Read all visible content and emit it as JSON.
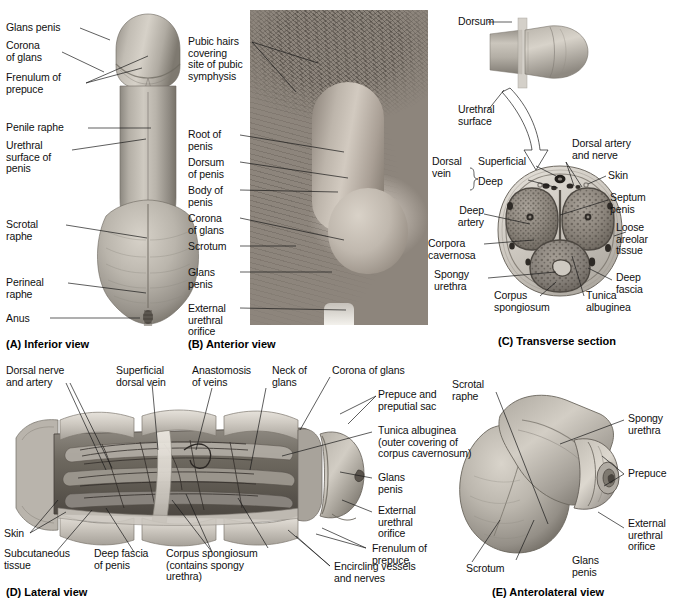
{
  "figure": {
    "background": "#ffffff",
    "line_color": "#1a1a1a"
  },
  "panels": [
    {
      "id": "A",
      "caption": "(A) Inferior view",
      "type": "illustration",
      "labels": [
        "Glans penis",
        "Corona\nof glans",
        "Frenulum of\nprepuce",
        "Penile raphe",
        "Urethral\nsurface of\npenis",
        "Scrotal\nraphe",
        "Perineal\nraphe",
        "Anus"
      ]
    },
    {
      "id": "B",
      "caption": "(B) Anterior view",
      "type": "photograph",
      "labels": [
        "Pubic hairs\ncovering\nsite of pubic\nsymphysis",
        "Root of\npenis",
        "Dorsum\nof penis",
        "Body of\npenis",
        "Corona\nof glans",
        "Scrotum",
        "Glans\npenis",
        "External\nurethral\norifice"
      ]
    },
    {
      "id": "C",
      "caption": "(C) Transverse section",
      "type": "illustration",
      "labels": [
        "Dorsum",
        "Urethral\nsurface",
        "Dorsal artery\nand nerve",
        "Dorsal\nvein",
        "Superficial",
        "Deep",
        "Skin",
        "Septum\npenis",
        "Loose\nareolar\ntissue",
        "Deep\nfascia",
        "Deep\nartery",
        "Corpora\ncavernosa",
        "Spongy\nurethra",
        "Corpus\nspongiosum",
        "Tunica\nalbuginea"
      ]
    },
    {
      "id": "D",
      "caption": "(D) Lateral view",
      "type": "illustration",
      "labels": [
        "Dorsal nerve\nand artery",
        "Superficial\ndorsal vein",
        "Anastomosis\nof veins",
        "Neck of\nglans",
        "Corona of glans",
        "Prepuce and\npreputial sac",
        "Tunica albuginea\n(outer covering of\ncorpus cavernosum)",
        "Glans\npenis",
        "External\nurethral\norifice",
        "Frenulum of\nprepuce",
        "Encircling vessels\nand nerves",
        "Skin",
        "Subcutaneous\ntissue",
        "Deep fascia\nof penis",
        "Corpus spongiosum\n(contains spongy\nurethra)"
      ]
    },
    {
      "id": "E",
      "caption": "(E) Anterolateral view",
      "type": "illustration",
      "labels": [
        "Scrotal\nraphe",
        "Spongy\nurethra",
        "Prepuce",
        "External\nurethral\norifice",
        "Glans\npenis",
        "Scrotum"
      ]
    }
  ],
  "panelA": {
    "caption": "(A) Inferior view",
    "l_glans_penis": "Glans penis",
    "l_corona": "Corona\nof glans",
    "l_frenulum": "Frenulum of\nprepuce",
    "l_penile_raphe": "Penile raphe",
    "l_urethral_surface": "Urethral\nsurface of\npenis",
    "l_scrotal_raphe": "Scrotal\nraphe",
    "l_perineal_raphe": "Perineal\nraphe",
    "l_anus": "Anus"
  },
  "panelB": {
    "caption": "(B) Anterior view",
    "l_pubic_hairs": "Pubic hairs\ncovering\nsite of pubic\nsymphysis",
    "l_root": "Root of\npenis",
    "l_dorsum": "Dorsum\nof penis",
    "l_body": "Body of\npenis",
    "l_corona": "Corona\nof glans",
    "l_scrotum": "Scrotum",
    "l_glans": "Glans\npenis",
    "l_external_orifice": "External\nurethral\norifice"
  },
  "panelC": {
    "caption": "(C) Transverse section",
    "l_dorsum": "Dorsum",
    "l_urethral_surface": "Urethral\nsurface",
    "l_dorsal_artery_nerve": "Dorsal artery\nand nerve",
    "l_dorsal_vein": "Dorsal\nvein",
    "l_superficial": "Superficial",
    "l_deep": "Deep",
    "l_skin": "Skin",
    "l_septum_penis": "Septum\npenis",
    "l_loose_areolar": "Loose\nareolar\ntissue",
    "l_deep_fascia": "Deep\nfascia",
    "l_deep_artery": "Deep\nartery",
    "l_corpora_cavernosa": "Corpora\ncavernosa",
    "l_spongy_urethra": "Spongy\nurethra",
    "l_corpus_spongiosum": "Corpus\nspongiosum",
    "l_tunica_albuginea": "Tunica\nalbuginea"
  },
  "panelD": {
    "caption": "(D) Lateral view",
    "l_dorsal_nerve_artery": "Dorsal nerve\nand artery",
    "l_superficial_dorsal_vein": "Superficial\ndorsal vein",
    "l_anastomosis": "Anastomosis\nof veins",
    "l_neck_of_glans": "Neck of\nglans",
    "l_corona": "Corona of glans",
    "l_prepuce_sac": "Prepuce and\npreputial sac",
    "l_tunica": "Tunica albuginea\n(outer covering of\ncorpus cavernosum)",
    "l_glans": "Glans\npenis",
    "l_external_orifice": "External\nurethral\norifice",
    "l_frenulum": "Frenulum of\nprepuce",
    "l_encircling": "Encircling vessels\nand nerves",
    "l_skin": "Skin",
    "l_subcutaneous": "Subcutaneous\ntissue",
    "l_deep_fascia": "Deep fascia\nof penis",
    "l_corpus_spongiosum": "Corpus spongiosum\n(contains spongy\nurethra)"
  },
  "panelE": {
    "caption": "(E) Anterolateral view",
    "l_scrotal_raphe": "Scrotal\nraphe",
    "l_spongy_urethra": "Spongy\nurethra",
    "l_prepuce": "Prepuce",
    "l_external_orifice": "External\nurethral\norifice",
    "l_glans": "Glans\npenis",
    "l_scrotum": "Scrotum"
  }
}
